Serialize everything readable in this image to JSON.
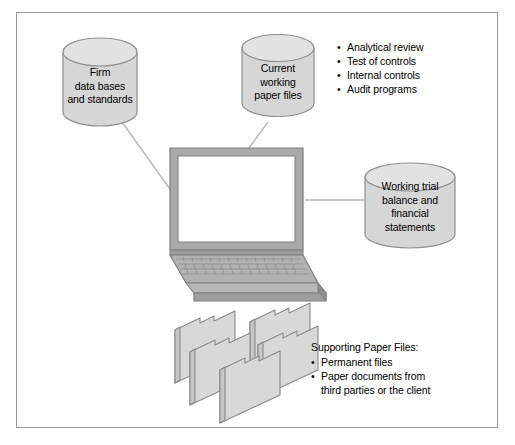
{
  "diagram": {
    "frame_border_color": "#9a9a9a",
    "shape_fill": "#d6d6d6",
    "shape_top_fill": "#e2e2e2",
    "shape_stroke": "#8f8f8f",
    "laptop_body_fill": "#aaaaaa",
    "laptop_screen_fill": "#ffffff",
    "folder_fill": "#d8d8d8",
    "connector_color": "#b0b0b0"
  },
  "cylinders": [
    {
      "id": "firm-databases",
      "lines": [
        "Firm",
        "data bases",
        "and standards"
      ]
    },
    {
      "id": "current-working-paper-files",
      "lines": [
        "Current",
        "working",
        "paper files"
      ]
    },
    {
      "id": "working-trial-balance",
      "lines": [
        "Working trial",
        "balance and",
        "financial",
        "statements"
      ]
    }
  ],
  "audit_list": {
    "items": [
      "Analytical review",
      "Test of controls",
      "Internal controls",
      "Audit programs"
    ],
    "bullet": "•"
  },
  "supporting_files": {
    "heading": "Supporting Paper Files:",
    "bullet": "•",
    "items": [
      {
        "line1": "Permanent files",
        "line2": ""
      },
      {
        "line1": "Paper documents from",
        "line2": "third parties or the client"
      }
    ]
  },
  "laptop": {
    "id": "laptop-illustration",
    "screen_label": ""
  },
  "folders": {
    "id": "paper-file-folders",
    "count": 5
  }
}
